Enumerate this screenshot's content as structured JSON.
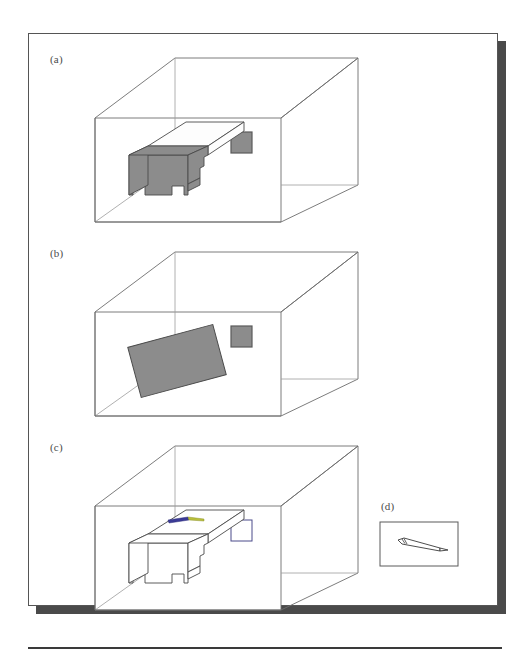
{
  "figure": {
    "background_color": "#ffffff",
    "page_card_color": "#ffffff",
    "page_border_color": "#555555",
    "page_shadow_color": "#4a4a4a",
    "bottom_rule_color": "#3a3a3a",
    "line_color": "#6d6d6d",
    "hidden_line_color": "#9c9c9c",
    "object_fill_gray": "#8c8c8c",
    "object_fill_light": "#fdfdfd",
    "object_outline_color": "#4a4a4a",
    "window_fill_gray": "#8c8c8c",
    "pen_body_color": "#3b3b96",
    "pen_tip_color": "#b9bf3a",
    "pen_outline_color": "#3a3a3a"
  },
  "panels": [
    {
      "id": "a",
      "label": "(a)",
      "description": "wireframe room with gray-shaded table and gray window square on back wall",
      "table_style": "shaded",
      "window_style": "shaded",
      "has_pen": false
    },
    {
      "id": "b",
      "label": "(b)",
      "description": "wireframe room with tilted gray rectangular slab and gray window square on back wall",
      "table_style": "slab",
      "window_style": "shaded",
      "has_pen": false
    },
    {
      "id": "c",
      "label": "(c)",
      "description": "wireframe room with unshaded outline table carrying a pen, and outline window square on back wall",
      "table_style": "outline",
      "window_style": "outline",
      "has_pen": true
    },
    {
      "id": "d",
      "label": "(d)",
      "description": "small framed rectangle containing an outline drawing of a pen",
      "table_style": "none",
      "window_style": "none",
      "has_pen": true
    }
  ]
}
